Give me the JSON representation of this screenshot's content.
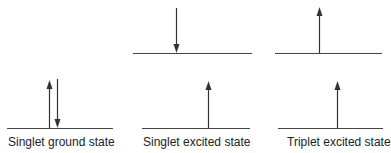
{
  "diagram": {
    "line_color": "#333333",
    "panels": [
      {
        "label": "Singlet ground state",
        "levels": [
          {
            "name": "ground-level"
          }
        ],
        "electrons": [
          {
            "level": "ground",
            "spin": "up"
          },
          {
            "level": "ground",
            "spin": "down"
          }
        ]
      },
      {
        "label": "Singlet excited state",
        "levels": [
          {
            "name": "upper-level"
          },
          {
            "name": "lower-level"
          }
        ],
        "electrons": [
          {
            "level": "upper",
            "spin": "down"
          },
          {
            "level": "lower",
            "spin": "up"
          }
        ]
      },
      {
        "label": "Triplet excited state",
        "levels": [
          {
            "name": "upper-level"
          },
          {
            "name": "lower-level"
          }
        ],
        "electrons": [
          {
            "level": "upper",
            "spin": "up"
          },
          {
            "level": "lower",
            "spin": "up"
          }
        ]
      }
    ]
  }
}
